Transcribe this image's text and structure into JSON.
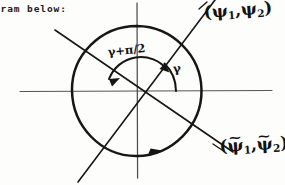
{
  "document": {
    "typed_fragment": "gram below:"
  },
  "diagram": {
    "type": "circle-axes-rotation",
    "ink_color": "#121212",
    "axis_color": "#4a4a4a",
    "background_color": "#fdfdfb",
    "center": {
      "x": 137,
      "y": 91
    },
    "circle_radius": 65,
    "axes": {
      "horizontal": {
        "x1": 20,
        "y1": 91,
        "x2": 272,
        "y2": 91
      },
      "vertical": {
        "x1": 137,
        "y1": 3,
        "x2": 137,
        "y2": 178
      }
    },
    "lines": [
      {
        "name": "psi-axis",
        "label": "(psi_1, psi_2)",
        "x1": 78,
        "y1": 182,
        "x2": 215,
        "y2": 0
      },
      {
        "name": "psi-tilde-axis",
        "label": "(psi-tilde_1, psi-tilde_2)",
        "x1": 55,
        "y1": 30,
        "x2": 233,
        "y2": 152
      }
    ],
    "labels": {
      "psi_pair": {
        "open": "(",
        "sym1": "ψ",
        "sub1": "1",
        "comma": ",",
        "sym2": "ψ",
        "sub2": "2",
        "close": ")"
      },
      "psi_tilde_pair": {
        "open": "(",
        "sym1": "ψ",
        "tilde1": "~",
        "sub1": "1",
        "comma": ",",
        "sym2": "ψ",
        "tilde2": "~",
        "sub2": "2",
        "close": ")"
      },
      "angle_gamma": "γ",
      "angle_gamma_plus_half_pi": "γ+π/2"
    },
    "arcs": [
      {
        "name": "gamma-arc",
        "description": "small counterclockwise arc from positive x-axis up to the psi line",
        "label": "γ"
      },
      {
        "name": "gamma-plus-half-pi-arc",
        "description": "large arc from psi line counterclockwise past vertical to upper-left direction",
        "label": "γ+π/2"
      },
      {
        "name": "circle-direction-arrow",
        "description": "arrowhead on circle at bottom indicating counterclockwise traversal"
      }
    ]
  }
}
